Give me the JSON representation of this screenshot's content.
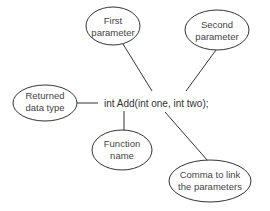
{
  "diagram": {
    "type": "annotated-code-callout",
    "code": "int Add(int one, int two);",
    "callouts": [
      {
        "id": "first-parameter",
        "lines": [
          "First",
          "parameter"
        ]
      },
      {
        "id": "second-parameter",
        "lines": [
          "Second",
          "parameter"
        ]
      },
      {
        "id": "returned-data-type",
        "lines": [
          "Returned",
          "data type"
        ]
      },
      {
        "id": "function-name",
        "lines": [
          "Function",
          "name"
        ]
      },
      {
        "id": "comma",
        "lines": [
          "Comma to link",
          "the parameters"
        ]
      }
    ],
    "colors": {
      "stroke": "#333333",
      "text": "#444444",
      "background": "#ffffff"
    }
  }
}
